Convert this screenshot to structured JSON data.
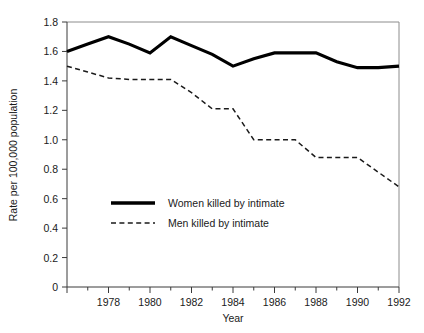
{
  "chart_data": {
    "type": "line",
    "title": "",
    "xlabel": "Year",
    "ylabel": "Rate per 100,000 population",
    "xlim": [
      1976,
      1992
    ],
    "ylim": [
      0,
      1.8
    ],
    "grid": false,
    "legend_position": "inside-left-lower",
    "x": [
      1976,
      1977,
      1978,
      1979,
      1980,
      1981,
      1982,
      1983,
      1984,
      1985,
      1986,
      1987,
      1988,
      1989,
      1990,
      1991,
      1992
    ],
    "xtick_labels": [
      "1978",
      "1980",
      "1982",
      "1984",
      "1986",
      "1988",
      "1990",
      "1992"
    ],
    "xtick_values": [
      1978,
      1980,
      1982,
      1984,
      1986,
      1988,
      1990,
      1992
    ],
    "xminor_values": [
      1977,
      1979,
      1981,
      1983,
      1985,
      1987,
      1989,
      1991
    ],
    "ytick_labels": [
      "0",
      "0.2",
      "0.4",
      "0.6",
      "0.8",
      "1.0",
      "1.2",
      "1.4",
      "1.6",
      "1.8"
    ],
    "ytick_values": [
      0,
      0.2,
      0.4,
      0.6,
      0.8,
      1.0,
      1.2,
      1.4,
      1.6,
      1.8
    ],
    "series": [
      {
        "name": "Women killed by intimate",
        "style": "solid",
        "color": "#000000",
        "values": [
          1.6,
          1.65,
          1.7,
          1.65,
          1.59,
          1.7,
          1.64,
          1.58,
          1.5,
          1.55,
          1.59,
          1.59,
          1.59,
          1.53,
          1.49,
          1.49,
          1.5
        ]
      },
      {
        "name": "Men killed by intimate",
        "style": "dashed",
        "color": "#1a1a1a",
        "values": [
          1.5,
          1.46,
          1.42,
          1.41,
          1.41,
          1.41,
          1.32,
          1.21,
          1.21,
          1.0,
          1.0,
          1.0,
          0.88,
          0.88,
          0.88,
          0.78,
          0.68
        ]
      }
    ]
  },
  "legend": {
    "items": [
      {
        "label": "Women killed by intimate",
        "style": "solid"
      },
      {
        "label": "Men killed by intimate",
        "style": "dashed"
      }
    ]
  }
}
